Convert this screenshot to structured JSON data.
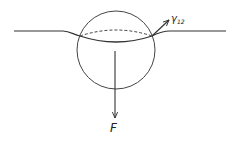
{
  "diagram": {
    "labels": {
      "surface_tension_symbol": "γ",
      "surface_tension_subscript": "12",
      "force": "F"
    },
    "colors": {
      "stroke": "#333333",
      "background": "#ffffff"
    }
  }
}
